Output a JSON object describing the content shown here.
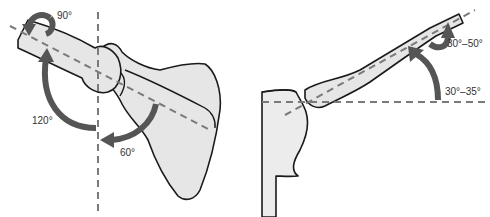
{
  "figure": {
    "left_panel": {
      "view": "posterior view of shoulder (humerus + scapula)",
      "labels": {
        "rotation": "90°",
        "elevation": "120°",
        "scapular": "60°"
      }
    },
    "right_panel": {
      "view": "superior view of shoulder (humerus + glenoid)",
      "labels": {
        "torsion": "30°–50°",
        "angle": "30°–35°"
      }
    },
    "colors": {
      "bone_fill": "#e6e6e6",
      "outline": "#1a1a1a",
      "axis_dash": "#7a7a7a",
      "arrow": "#555555"
    }
  }
}
